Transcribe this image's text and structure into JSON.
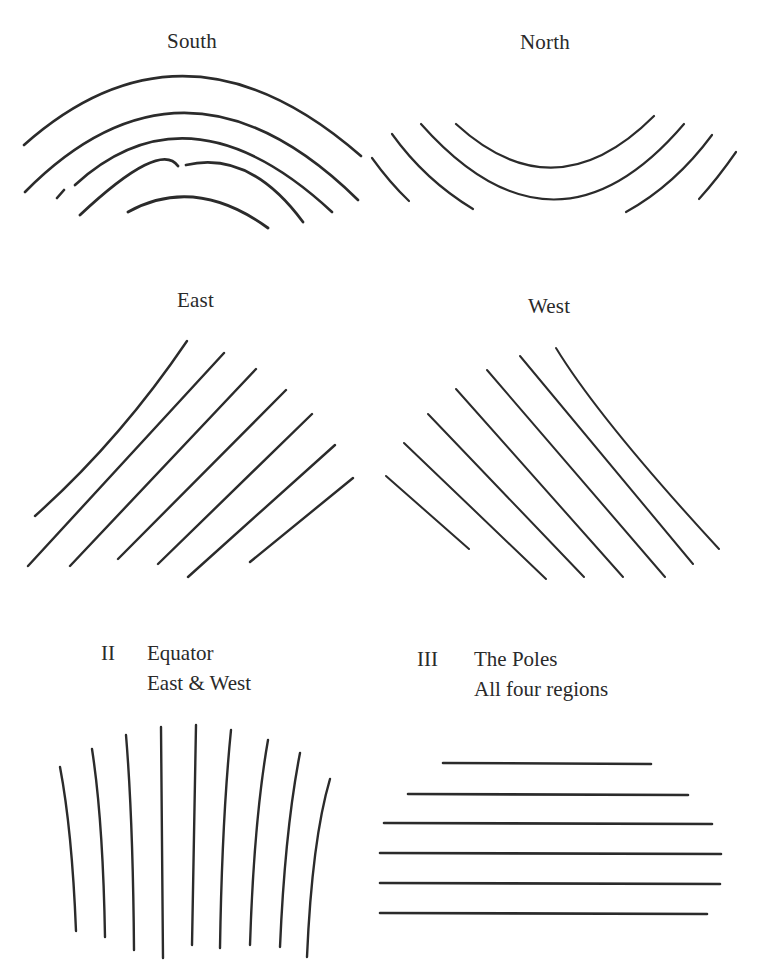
{
  "figure": {
    "colors": {
      "ink": "#2b2b2b",
      "paper": "#ffffff"
    },
    "panels": {
      "south": {
        "label": "South",
        "line_count": 5,
        "pattern": "concentric arcs, convex upward"
      },
      "north": {
        "label": "North",
        "line_count": 4,
        "pattern": "concentric arcs, concave upward (outer two broken in middle)"
      },
      "east": {
        "label": "East",
        "line_count": 7,
        "pattern": "parallel diagonal lines rising to the right"
      },
      "west": {
        "label": "West",
        "line_count": 7,
        "pattern": "parallel diagonal lines falling to the right"
      },
      "equator": {
        "numeral": "II",
        "title": "Equator",
        "subtitle": "East & West",
        "line_count": 9,
        "pattern": "near-vertical lines fanning outward"
      },
      "poles": {
        "numeral": "III",
        "title": "The Poles",
        "subtitle": "All four regions",
        "line_count": 6,
        "pattern": "horizontal lines"
      }
    }
  }
}
